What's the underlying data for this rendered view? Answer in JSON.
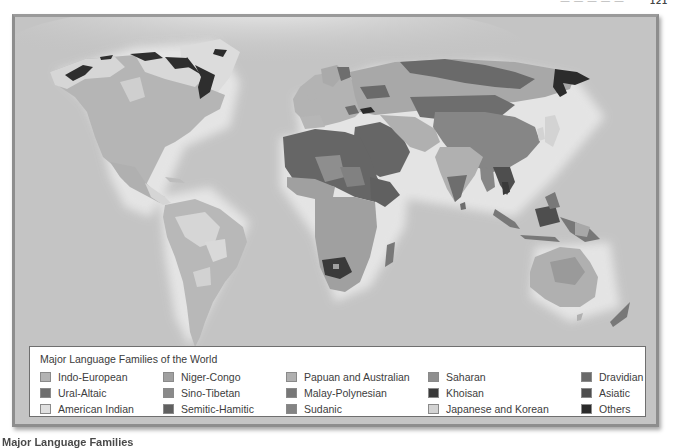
{
  "page_header": {
    "running_text": "— — — — —",
    "page_number": "121"
  },
  "map": {
    "ocean_color": "#c4c4c4",
    "regions": {
      "american_indian": "#d9d9d9",
      "indo_european": "#b3b3b3",
      "ural_altaic": "#6e6e6e",
      "semitic_hamitic": "#666666",
      "niger_congo": "#9a9a9a",
      "sudanic": "#7f7f7f",
      "saharan": "#8c8c8c",
      "khoisan": "#3a3a3a",
      "sino_tibetan": "#858585",
      "dravidian": "#707070",
      "asiatic": "#4f4f4f",
      "japanese_korean": "#d0d0d0",
      "malay_polynesian": "#787878",
      "papuan_australian": "#a8a8a8",
      "others": "#2c2c2c"
    }
  },
  "legend": {
    "title": "Major Language Families of the World",
    "items": [
      {
        "label": "Indo-European",
        "color": "#b3b3b3"
      },
      {
        "label": "Ural-Altaic",
        "color": "#6e6e6e"
      },
      {
        "label": "American Indian",
        "color": "#e0e0e0"
      },
      {
        "label": "Niger-Congo",
        "color": "#a0a0a0"
      },
      {
        "label": "Sino-Tibetan",
        "color": "#8a8a8a"
      },
      {
        "label": "Semitic-Hamitic",
        "color": "#606060"
      },
      {
        "label": "Papuan and Australian",
        "color": "#b0b0b0"
      },
      {
        "label": "Malay-Polynesian",
        "color": "#777777"
      },
      {
        "label": "Sudanic",
        "color": "#838383"
      },
      {
        "label": "Saharan",
        "color": "#8f8f8f"
      },
      {
        "label": "Khoisan",
        "color": "#3a3a3a"
      },
      {
        "label": "Japanese and Korean",
        "color": "#d3d3d3"
      },
      {
        "label": "Dravidian",
        "color": "#6a6a6a"
      },
      {
        "label": "Asiatic",
        "color": "#4e4e4e"
      },
      {
        "label": "Others",
        "color": "#2a2a2a"
      }
    ]
  },
  "caption": {
    "text": "Major Language Families"
  }
}
